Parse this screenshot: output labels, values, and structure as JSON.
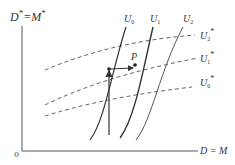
{
  "diagram": {
    "y_axis_label": "D* = M*",
    "y_axis_label_main": "D",
    "y_axis_label_eq": "=M",
    "star": "*",
    "x_axis_label": "D = M",
    "origin_label": "0",
    "point_label": "P",
    "solid_curves": [
      {
        "label": "U",
        "sub": "0"
      },
      {
        "label": "U",
        "sub": "1"
      },
      {
        "label": "U",
        "sub": "2"
      }
    ],
    "dashed_curves": [
      {
        "label": "U",
        "sub": "2",
        "star": "*"
      },
      {
        "label": "U",
        "sub": "1",
        "star": "*"
      },
      {
        "label": "U",
        "sub": "0",
        "star": "*"
      }
    ],
    "colors": {
      "line": "#333333",
      "dashed": "#666666",
      "axis": "#555555",
      "background": "#ffffff"
    }
  }
}
